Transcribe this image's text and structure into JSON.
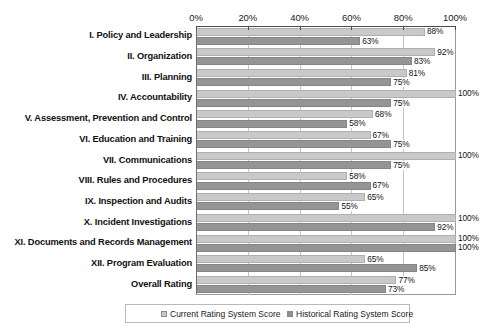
{
  "chart_data": {
    "type": "bar",
    "orientation": "horizontal",
    "title": "",
    "xlabel": "",
    "ylabel": "",
    "xlim": [
      0,
      100
    ],
    "grid": true,
    "legend_position": "bottom",
    "axis_ticks": [
      "0%",
      "20%",
      "40%",
      "60%",
      "80%",
      "100%"
    ],
    "axis_tick_values": [
      0,
      20,
      40,
      60,
      80,
      100
    ],
    "categories": [
      "I.    Policy and Leadership",
      "II.   Organization",
      "III.  Planning",
      "IV.  Accountability",
      "V.   Assessment, Prevention and Control",
      "VI.  Education and Training",
      "VII.  Communications",
      "VIII. Rules and Procedures",
      "IX.   Inspection and Audits",
      "X.    Incident Investigations",
      "XI.  Documents and Records Management",
      "XII.  Program Evaluation",
      "Overall Rating"
    ],
    "series": [
      {
        "name": "Current Rating System Score",
        "color": "#c9c9c9",
        "values": [
          88,
          92,
          81,
          100,
          68,
          67,
          100,
          58,
          65,
          100,
          100,
          65,
          77
        ],
        "labels": [
          "88%",
          "92%",
          "81%",
          "100%",
          "68%",
          "67%",
          "100%",
          "58%",
          "65%",
          "100%",
          "100%",
          "65%",
          "77%"
        ]
      },
      {
        "name": "Historical Rating System Score",
        "color": "#959595",
        "values": [
          63,
          83,
          75,
          75,
          58,
          75,
          75,
          67,
          55,
          92,
          100,
          85,
          73
        ],
        "labels": [
          "63%",
          "83%",
          "75%",
          "75%",
          "58%",
          "75%",
          "75%",
          "67%",
          "55%",
          "92%",
          "100%",
          "85%",
          "73%"
        ]
      }
    ]
  },
  "legend": {
    "items": [
      {
        "label": "Current Rating System Score"
      },
      {
        "label": "Historical Rating System Score"
      }
    ]
  }
}
